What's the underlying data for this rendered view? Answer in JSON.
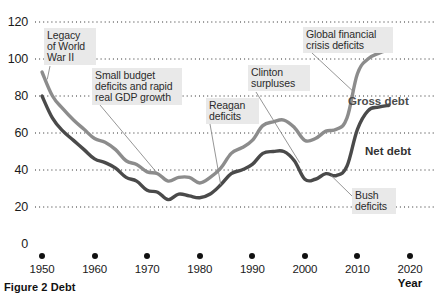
{
  "figure": {
    "caption": "Figure 2  Debt",
    "cut_title": "",
    "axis_year_word": "Year"
  },
  "chart_data": {
    "type": "line",
    "title": "Debt",
    "xlabel": "Year",
    "ylabel": "",
    "xlim": [
      1950,
      2020
    ],
    "ylim": [
      0,
      120
    ],
    "yticks": [
      0,
      20,
      40,
      60,
      80,
      100,
      120
    ],
    "xticks": [
      1950,
      1960,
      1970,
      1980,
      1990,
      2000,
      2010,
      2020
    ],
    "grid": "horizontal-dotted",
    "legend_position": "inline-labels",
    "units": "percent of GDP",
    "series": [
      {
        "name": "Gross debt",
        "color": "#8c8c8c",
        "x": [
          1950,
          1952,
          1954,
          1956,
          1958,
          1960,
          1962,
          1964,
          1966,
          1968,
          1970,
          1972,
          1974,
          1976,
          1978,
          1980,
          1982,
          1984,
          1986,
          1988,
          1990,
          1992,
          1994,
          1996,
          1998,
          2000,
          2002,
          2004,
          2006,
          2008,
          2010,
          2012,
          2014,
          2016
        ],
        "values": [
          93,
          80,
          73,
          67,
          62,
          57,
          55,
          51,
          45,
          43,
          39,
          38,
          34,
          36,
          36,
          33,
          36,
          41,
          49,
          52,
          56,
          64,
          66,
          67,
          63,
          56,
          57,
          61,
          62,
          68,
          92,
          100,
          103,
          105
        ]
      },
      {
        "name": "Net debt",
        "color": "#4a4a4a",
        "x": [
          1950,
          1952,
          1954,
          1956,
          1958,
          1960,
          1962,
          1964,
          1966,
          1968,
          1970,
          1972,
          1974,
          1976,
          1978,
          1980,
          1982,
          1984,
          1986,
          1988,
          1990,
          1992,
          1994,
          1996,
          1998,
          2000,
          2002,
          2004,
          2006,
          2008,
          2010,
          2012,
          2014,
          2016
        ],
        "values": [
          80,
          68,
          61,
          56,
          51,
          46,
          44,
          41,
          36,
          34,
          29,
          28,
          24,
          27,
          26,
          25,
          27,
          32,
          38,
          40,
          43,
          49,
          50,
          50,
          45,
          35,
          35,
          38,
          37,
          42,
          62,
          72,
          74,
          75
        ]
      }
    ],
    "annotations": [
      {
        "id": "legacy-wwii",
        "text": "Legacy\nof World\nWar II",
        "point_year": 1951,
        "point_value": 89
      },
      {
        "id": "small-deficits",
        "text": "Small budget\ndeficits and rapid\nreal GDP growth",
        "point_year": 1972,
        "point_value": 38
      },
      {
        "id": "reagan-deficits",
        "text": "Reagan\ndeficits",
        "point_year": 1984,
        "point_value": 32
      },
      {
        "id": "clinton-surpluses",
        "text": "Clinton\nsurpluses",
        "point_year": 1999,
        "point_value": 44
      },
      {
        "id": "global-financial-crisis",
        "text": "Global financial\ncrisis deficits",
        "point_year": 2009,
        "point_value": 83
      },
      {
        "id": "bush-deficits",
        "text": "Bush\ndeficits",
        "point_year": 2005,
        "point_value": 37
      }
    ],
    "series_labels": [
      {
        "id": "gross-debt-label",
        "text": "Gross debt"
      },
      {
        "id": "net-debt-label",
        "text": "Net debt"
      }
    ]
  }
}
